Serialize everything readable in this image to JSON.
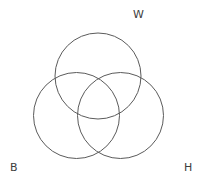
{
  "diagram": {
    "type": "venn-3-circle",
    "background_color": "#ffffff",
    "stroke_color": "#5b5b5b",
    "label_color": "#3d3d3d",
    "labels": [
      {
        "id": "w",
        "text": "W",
        "x": 133,
        "y": 9,
        "anchor": "top-right-outside"
      },
      {
        "id": "b",
        "text": "B",
        "x": 10,
        "y": 162,
        "anchor": "bottom-left-outside"
      },
      {
        "id": "h",
        "text": "H",
        "x": 184,
        "y": 162,
        "anchor": "bottom-right-outside"
      }
    ],
    "circles": [
      {
        "id": "top",
        "label": "W",
        "cx": 98,
        "cy": 76,
        "r": 43
      },
      {
        "id": "bottom-left",
        "label": "B",
        "cx": 76.5,
        "cy": 115.5,
        "r": 43
      },
      {
        "id": "bottom-right",
        "label": "H",
        "cx": 120.5,
        "cy": 115.5,
        "r": 43
      }
    ]
  }
}
